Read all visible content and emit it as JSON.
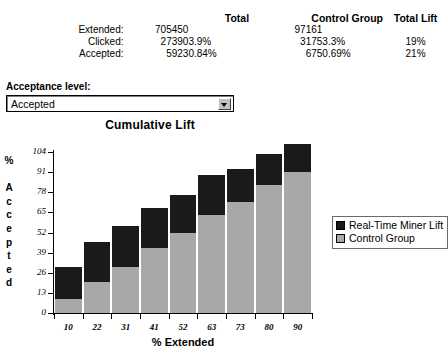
{
  "summary": {
    "group_headers": [
      "",
      "Total",
      "",
      "Control Group",
      "",
      "Total Lift"
    ],
    "headers": {
      "total": "Total",
      "control_group": "Control Group",
      "total_lift": "Total Lift"
    },
    "rows": [
      {
        "label": "Extended:",
        "total_count": "705450",
        "total_pct": "",
        "control_count": "97161",
        "control_pct": "",
        "total_lift": ""
      },
      {
        "label": "Clicked:",
        "total_count": "27390",
        "total_pct": "3.9%",
        "control_count": "3175",
        "control_pct": "3.3%",
        "total_lift": "19%"
      },
      {
        "label": "Accepted:",
        "total_count": "5923",
        "total_pct": "0.84%",
        "control_count": "675",
        "control_pct": "0.69%",
        "total_lift": "21%"
      }
    ]
  },
  "acceptance": {
    "label": "Acceptance level:",
    "value": "Accepted",
    "options": [
      "Accepted"
    ],
    "arrow_icon": "chevron-down-icon"
  },
  "chart_data": {
    "type": "bar",
    "stacked": true,
    "title": "Cumulative Lift",
    "xlabel": "% Extended",
    "ylabel": "% Accepted",
    "grid": false,
    "legend_position": "right",
    "categories": [
      "10",
      "22",
      "31",
      "41",
      "52",
      "63",
      "73",
      "80",
      "90"
    ],
    "yticks": [
      0,
      13,
      26,
      39,
      52,
      65,
      78,
      91,
      104
    ],
    "ylim": [
      0,
      104
    ],
    "series": [
      {
        "name": "Control Group",
        "color": "#a8a8a8",
        "values": [
          9,
          20,
          30,
          42,
          52,
          63,
          72,
          83,
          91
        ]
      },
      {
        "name": "Real-Time Miner Lift",
        "color": "#1a1a1a",
        "values": [
          21,
          26,
          26,
          26,
          24,
          26,
          21,
          20,
          18
        ]
      }
    ],
    "totals": [
      30,
      46,
      56,
      68,
      76,
      89,
      93,
      103,
      109
    ],
    "legend": [
      "Real-Time Miner Lift",
      "Control Group"
    ]
  }
}
